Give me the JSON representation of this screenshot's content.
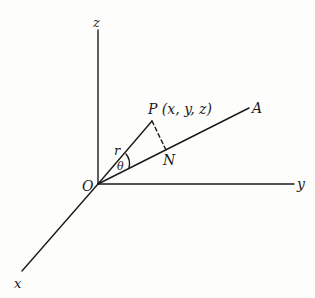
{
  "diagram": {
    "axes": {
      "x_label": "x",
      "y_label": "y",
      "z_label": "z",
      "origin_label": "O"
    },
    "points": {
      "P_label": "P (x, y, z)",
      "N_label": "N",
      "A_label": "A"
    },
    "segments": {
      "r_label": "r",
      "angle_label": "θ"
    },
    "colors": {
      "ink": "#1a1a1a",
      "background": "#fdfdfc"
    }
  }
}
